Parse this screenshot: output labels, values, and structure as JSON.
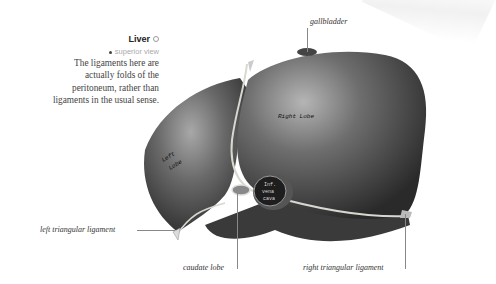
{
  "figure": {
    "title": "Liver",
    "title_icon": "circle-info-icon",
    "view": "superior view",
    "description": "The ligaments here are actually folds of the peritoneum, rather than ligaments in the usual sense.",
    "description_lines": [
      "The ligaments here are",
      "actually folds of the",
      "peritoneum, rather than",
      "ligaments in the usual sense."
    ]
  },
  "labels": {
    "gallbladder": "gallbladder",
    "left_triangular_ligament": "left triangular ligament",
    "caudate_lobe": "caudate lobe",
    "right_triangular_ligament": "right triangular ligament"
  },
  "inner_labels": {
    "right_lobe": "Right Lobe",
    "left_lobe_1": "Left",
    "left_lobe_2": "Lobe",
    "vena_cava_1": "Inf.",
    "vena_cava_2": "vena",
    "vena_cava_3": "cava"
  },
  "colors": {
    "organ_dark": "#3a3a3a",
    "organ_light": "#9a9a9a",
    "ligament": "#d8d8d0"
  }
}
